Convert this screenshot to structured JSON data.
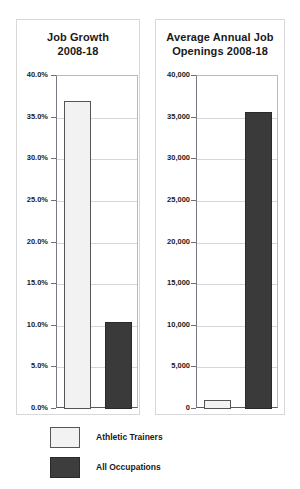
{
  "legend": {
    "items": [
      {
        "label": "Athletic Trainers",
        "swatch": "light",
        "color": "#f2f2f2"
      },
      {
        "label": "All Occupations",
        "swatch": "dark",
        "color": "#3d3d3d"
      }
    ]
  },
  "chart_data": [
    {
      "type": "bar",
      "id": "job-growth",
      "title": "Job Growth 2008-18",
      "title_lines": [
        "Job Growth",
        "2008-18"
      ],
      "categories": [
        "Athletic Trainers",
        "All Occupations"
      ],
      "values": [
        37.0,
        10.5
      ],
      "series": [
        {
          "name": "Athletic Trainers",
          "values": [
            37.0
          ]
        },
        {
          "name": "All Occupations",
          "values": [
            10.5
          ]
        }
      ],
      "xlabel": "",
      "ylabel": "",
      "ylim": [
        0,
        40
      ],
      "ytick_step": 5,
      "yticks": [
        40,
        35,
        30,
        25,
        20,
        15,
        10,
        5,
        0
      ],
      "ytick_labels": [
        "40.0%",
        "35.0%",
        "30.0%",
        "25.0%",
        "20.0%",
        "15.0%",
        "10.0%",
        "5.0%",
        "0.0%"
      ],
      "grid": true,
      "legend_position": "bottom"
    },
    {
      "type": "bar",
      "id": "average-annual-job-openings",
      "title": "Average Annual Job Openings 2008-18",
      "title_lines": [
        "Average Annual Job",
        "Openings 2008-18"
      ],
      "categories": [
        "Athletic Trainers",
        "All Occupations"
      ],
      "values": [
        1100,
        35700
      ],
      "series": [
        {
          "name": "Athletic Trainers",
          "values": [
            1100
          ]
        },
        {
          "name": "All Occupations",
          "values": [
            35700
          ]
        }
      ],
      "xlabel": "",
      "ylabel": "",
      "ylim": [
        0,
        40000
      ],
      "ytick_step": 5000,
      "yticks": [
        40000,
        35000,
        30000,
        25000,
        20000,
        15000,
        10000,
        5000,
        0
      ],
      "ytick_labels": [
        "40,000",
        "35,000",
        "30,000",
        "25,000",
        "20,000",
        "15,000",
        "10,000",
        "5,000",
        "0"
      ],
      "grid": true,
      "legend_position": "bottom"
    }
  ]
}
